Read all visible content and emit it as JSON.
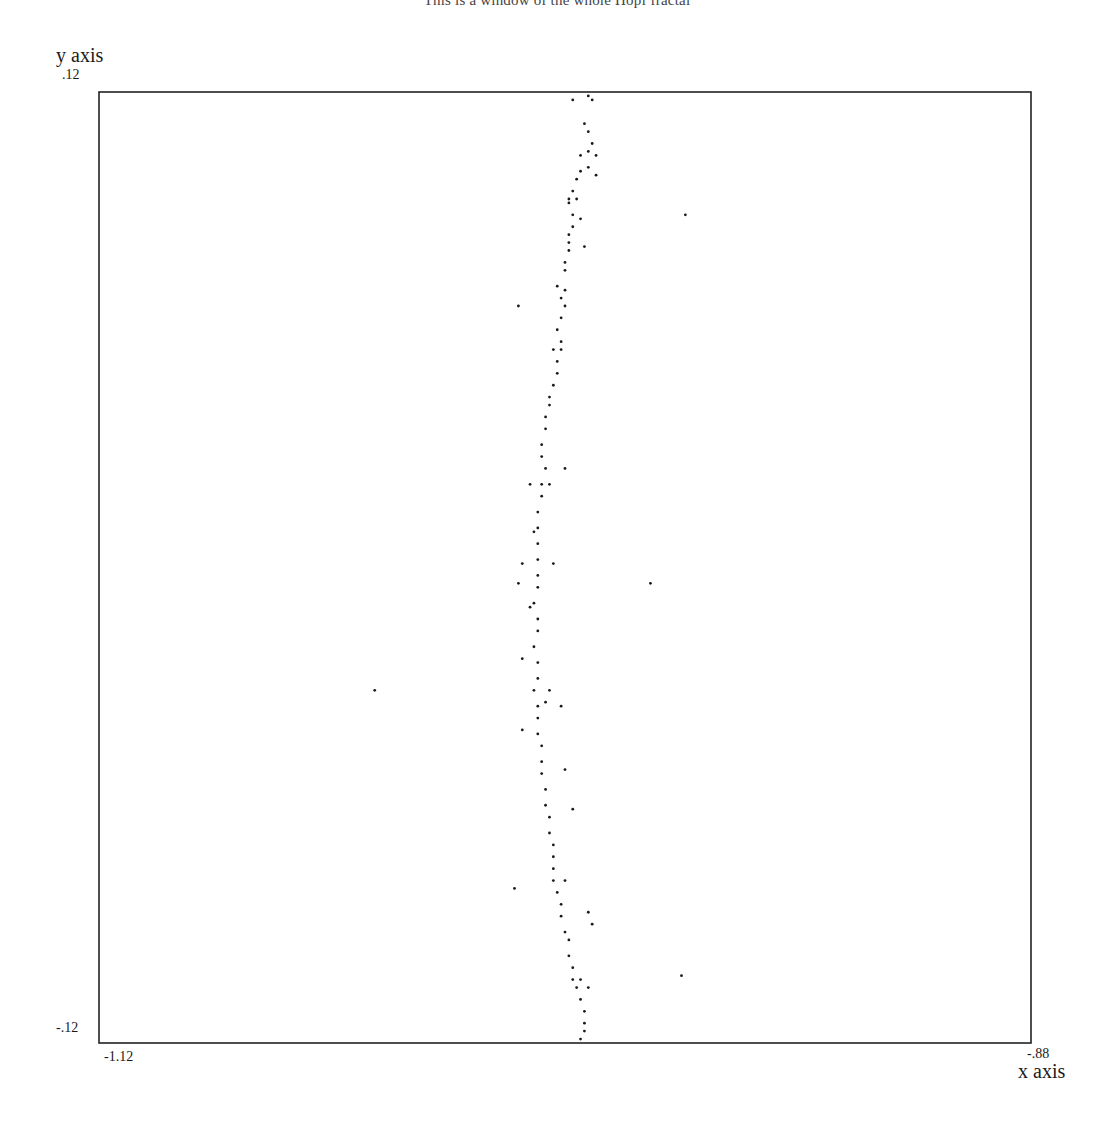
{
  "title": "This is a window of the whole Hopf fractal",
  "chart_data": {
    "type": "scatter",
    "title": "This is a window of the whole Hopf fractal",
    "xlabel": "x axis",
    "ylabel": "y axis",
    "xlim": [
      -1.12,
      -0.88
    ],
    "ylim": [
      -0.12,
      0.12
    ],
    "x_tick_labels": [
      "-1.12",
      "-.88"
    ],
    "y_tick_labels": [
      ".12",
      "-.12"
    ],
    "grid": false,
    "legend": null,
    "marker_color": "#1a1a1a",
    "series": [
      {
        "name": "fractal points",
        "points": [
          [
            -0.994,
            0.119
          ],
          [
            -0.993,
            0.118
          ],
          [
            -0.995,
            0.112
          ],
          [
            -0.994,
            0.11
          ],
          [
            -0.993,
            0.107
          ],
          [
            -0.994,
            0.105
          ],
          [
            -0.996,
            0.104
          ],
          [
            -0.992,
            0.104
          ],
          [
            -0.994,
            0.101
          ],
          [
            -0.996,
            0.1
          ],
          [
            -0.997,
            0.098
          ],
          [
            -0.998,
            0.095
          ],
          [
            -0.999,
            0.093
          ],
          [
            -0.997,
            0.093
          ],
          [
            -0.998,
            0.089
          ],
          [
            -0.996,
            0.088
          ],
          [
            -0.998,
            0.086
          ],
          [
            -0.999,
            0.084
          ],
          [
            -0.999,
            0.082
          ],
          [
            -0.999,
            0.08
          ],
          [
            -1.0,
            0.077
          ],
          [
            -1.0,
            0.075
          ],
          [
            -1.002,
            0.071
          ],
          [
            -1.0,
            0.07
          ],
          [
            -1.001,
            0.068
          ],
          [
            -1.0,
            0.066
          ],
          [
            -1.001,
            0.063
          ],
          [
            -1.002,
            0.06
          ],
          [
            -1.001,
            0.057
          ],
          [
            -1.001,
            0.055
          ],
          [
            -1.002,
            0.052
          ],
          [
            -1.002,
            0.049
          ],
          [
            -1.003,
            0.046
          ],
          [
            -1.004,
            0.043
          ],
          [
            -1.004,
            0.041
          ],
          [
            -1.005,
            0.038
          ],
          [
            -1.005,
            0.035
          ],
          [
            -1.006,
            0.031
          ],
          [
            -1.006,
            0.028
          ],
          [
            -1.005,
            0.025
          ],
          [
            -1.006,
            0.021
          ],
          [
            -1.006,
            0.018
          ],
          [
            -1.007,
            0.014
          ],
          [
            -1.007,
            0.01
          ],
          [
            -1.007,
            0.006
          ],
          [
            -1.007,
            0.002
          ],
          [
            -1.007,
            -0.002
          ],
          [
            -1.007,
            -0.005
          ],
          [
            -1.008,
            -0.009
          ],
          [
            -1.007,
            -0.013
          ],
          [
            -1.007,
            -0.016
          ],
          [
            -1.008,
            -0.02
          ],
          [
            -1.007,
            -0.024
          ],
          [
            -1.007,
            -0.028
          ],
          [
            -1.008,
            -0.031
          ],
          [
            -1.007,
            -0.035
          ],
          [
            -1.007,
            -0.038
          ],
          [
            -1.007,
            -0.042
          ],
          [
            -1.006,
            -0.045
          ],
          [
            -1.006,
            -0.049
          ],
          [
            -1.006,
            -0.052
          ],
          [
            -1.005,
            -0.056
          ],
          [
            -1.005,
            -0.06
          ],
          [
            -1.004,
            -0.063
          ],
          [
            -1.004,
            -0.067
          ],
          [
            -1.003,
            -0.07
          ],
          [
            -1.003,
            -0.073
          ],
          [
            -1.003,
            -0.076
          ],
          [
            -1.003,
            -0.079
          ],
          [
            -1.002,
            -0.082
          ],
          [
            -1.001,
            -0.085
          ],
          [
            -1.001,
            -0.088
          ],
          [
            -1.0,
            -0.092
          ],
          [
            -0.999,
            -0.094
          ],
          [
            -0.999,
            -0.098
          ],
          [
            -0.998,
            -0.101
          ],
          [
            -0.998,
            -0.104
          ],
          [
            -0.997,
            -0.106
          ],
          [
            -0.996,
            -0.109
          ],
          [
            -0.995,
            -0.112
          ],
          [
            -0.995,
            -0.115
          ],
          [
            -0.995,
            -0.117
          ],
          [
            -0.996,
            -0.119
          ],
          [
            -0.998,
            0.118
          ],
          [
            -0.999,
            0.092
          ],
          [
            -0.992,
            0.099
          ],
          [
            -0.995,
            0.081
          ],
          [
            -1.009,
            0.021
          ],
          [
            -1.004,
            0.021
          ],
          [
            -1.0,
            0.025
          ],
          [
            -1.008,
            0.009
          ],
          [
            -1.004,
            -0.031
          ],
          [
            -1.011,
            -0.041
          ],
          [
            -1.005,
            -0.034
          ],
          [
            -1.0,
            -0.051
          ],
          [
            -1.009,
            -0.01
          ],
          [
            -1.011,
            -0.023
          ],
          [
            -0.998,
            -0.061
          ],
          [
            -1.0,
            -0.079
          ],
          [
            -0.994,
            -0.087
          ],
          [
            -0.993,
            -0.09
          ],
          [
            -0.996,
            -0.104
          ],
          [
            -0.994,
            -0.106
          ]
        ]
      },
      {
        "name": "outliers",
        "points": [
          [
            -0.969,
            0.089
          ],
          [
            -1.012,
            0.066
          ],
          [
            -1.011,
            0.001
          ],
          [
            -0.978,
            -0.004
          ],
          [
            -1.012,
            -0.004
          ],
          [
            -1.049,
            -0.031
          ],
          [
            -1.013,
            -0.081
          ],
          [
            -0.97,
            -0.103
          ],
          [
            -1.003,
            0.055
          ],
          [
            -1.001,
            -0.035
          ],
          [
            -1.003,
            0.001
          ]
        ]
      }
    ]
  }
}
